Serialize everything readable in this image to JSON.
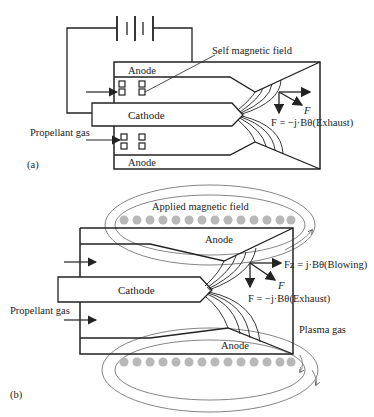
{
  "panel_a": {
    "label": "(a)",
    "self_field_label": "Self magnetic field",
    "anode_top": "Anode",
    "anode_bottom": "Anode",
    "cathode": "Cathode",
    "propellant": "Propellant gas",
    "force_label": "F",
    "exhaust_eq": "F = −j·Bθ(Exhaust)"
  },
  "panel_b": {
    "label": "(b)",
    "applied_field_label": "Applied magnetic field",
    "anode_top": "Anode",
    "anode_bottom": "Anode",
    "cathode": "Cathode",
    "propellant": "Propellant gas",
    "blowing_eq": "Fz = j·Bθ(Blowing)",
    "force_label": "F",
    "exhaust_eq": "F = −j·Bθ(Exhaust)",
    "plasma": "Plasma gas"
  },
  "colors": {
    "line": "#222222",
    "coil": "#b8b8b8",
    "field": "#666666"
  }
}
